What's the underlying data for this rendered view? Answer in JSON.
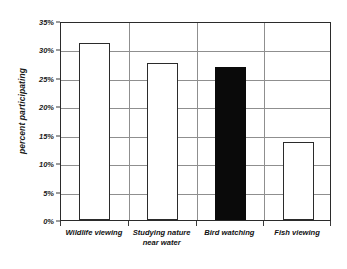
{
  "chart_data": {
    "type": "bar",
    "title": "",
    "subtitle": "",
    "xlabel": "",
    "ylabel": "percent participating",
    "ylim": [
      0,
      35
    ],
    "ytick_values": [
      35,
      30,
      25,
      20,
      15,
      10,
      5,
      0
    ],
    "ytick_labels": [
      "35%",
      "30%",
      "25%",
      "20%",
      "15%",
      "10%",
      "5%",
      "0%"
    ],
    "grid": true,
    "legend": "none",
    "categories": [
      "Wildlife viewing",
      "Studying nature near water",
      "Bird watching",
      "Fish viewing"
    ],
    "category_label_lines": [
      [
        "Wildlife viewing"
      ],
      [
        "Studying nature",
        "near water"
      ],
      [
        "Bird watching"
      ],
      [
        "Fish viewing"
      ]
    ],
    "values": [
      31.2,
      27.6,
      27.0,
      13.8
    ],
    "bar_styles": [
      "open",
      "open",
      "solid",
      "open"
    ],
    "highlighted_category": "Bird watching",
    "colors": {
      "bar_fill_open": "#ffffff",
      "bar_fill_solid": "#0a0a0a",
      "bar_outline": "#2b2b2b",
      "gridline": "#8f8f8f",
      "axis": "#2b2b2b",
      "text": "#111111",
      "background": "#ffffff"
    }
  }
}
